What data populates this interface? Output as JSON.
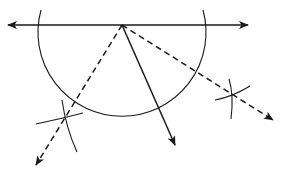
{
  "diagram": {
    "title": "",
    "colors": {
      "stroke": "#1a1a1a",
      "background": "#ffffff"
    },
    "vertex": {
      "x": 122,
      "y": 25
    },
    "line": {
      "x1": 8,
      "x2": 248,
      "y": 25,
      "arrows": "both"
    },
    "semicircle": {
      "cx": 122,
      "cy": 25,
      "r": 84
    },
    "solid_ray": {
      "x2": 175,
      "y2": 145
    },
    "dashed_rays": [
      {
        "name": "left-bisector",
        "x2": 36,
        "y2": 165,
        "crossing": {
          "x": 65,
          "y": 120
        }
      },
      {
        "name": "right-bisector",
        "x2": 273,
        "y2": 120,
        "crossing": {
          "x": 232,
          "y": 95
        }
      }
    ],
    "labels": []
  }
}
